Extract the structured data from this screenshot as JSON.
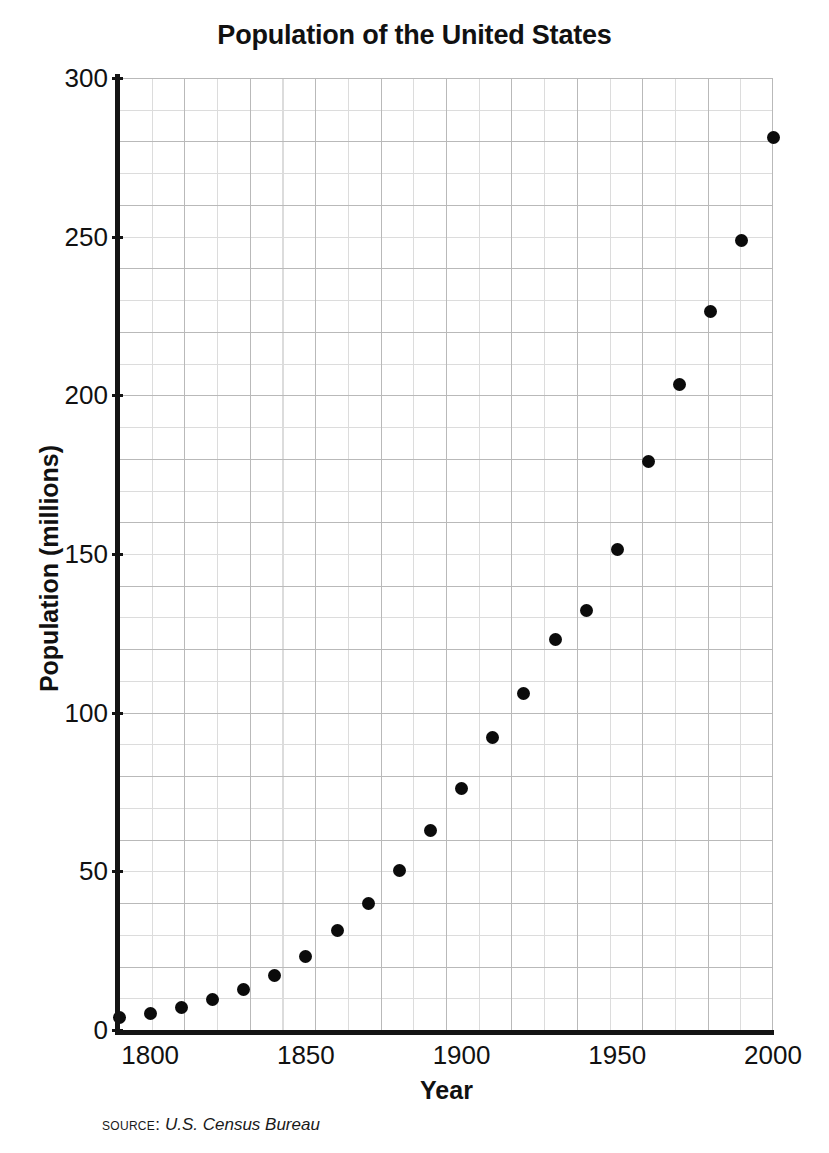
{
  "chart_data": {
    "type": "scatter",
    "title": "Population of the United States",
    "xlabel": "Year",
    "ylabel": "Population (millions)",
    "xlim": [
      1790,
      2000
    ],
    "ylim": [
      0,
      300
    ],
    "xticks": [
      "1800",
      "1850",
      "1900",
      "1950",
      "2000"
    ],
    "xtick_values": [
      1800,
      1850,
      1900,
      1950,
      2000
    ],
    "yticks": [
      "0",
      "50",
      "100",
      "150",
      "200",
      "250",
      "300"
    ],
    "ytick_values": [
      0,
      50,
      100,
      150,
      200,
      250,
      300
    ],
    "grid": true,
    "grid_minor_step_x": 10,
    "grid_minor_step_y": 10,
    "grid_major_step_x": 20,
    "grid_major_step_y": 20,
    "legend": null,
    "marker_color": "#0b0b0b",
    "x": [
      1790,
      1800,
      1810,
      1820,
      1830,
      1840,
      1850,
      1860,
      1870,
      1880,
      1890,
      1900,
      1910,
      1920,
      1930,
      1940,
      1950,
      1960,
      1970,
      1980,
      1990,
      2000
    ],
    "values": [
      3.9,
      5.3,
      7.2,
      9.6,
      12.9,
      17.1,
      23.2,
      31.4,
      39.8,
      50.2,
      62.9,
      76.2,
      92.2,
      106.0,
      123.2,
      132.2,
      151.3,
      179.3,
      203.3,
      226.5,
      248.7,
      281.4
    ]
  },
  "source": {
    "label": "Source:",
    "value": "U.S. Census Bureau"
  }
}
